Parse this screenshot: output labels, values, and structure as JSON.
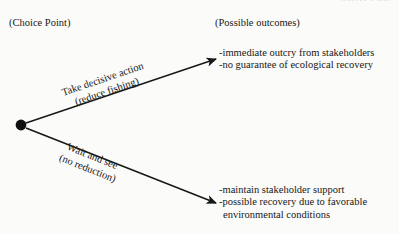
{
  "page": {
    "width": 399,
    "height": 234,
    "background_color": "#fbfbf9",
    "ink_color": "#171717",
    "running_header": "CHAPTER"
  },
  "headings": {
    "choice_point": "(Choice Point)",
    "possible_outcomes": "(Possible outcomes)"
  },
  "diagram": {
    "type": "decision-tree",
    "node": {
      "label": "",
      "shape": "filled-circle",
      "x": 21,
      "y": 125,
      "radius": 5
    },
    "branches": [
      {
        "id": "decisive-action",
        "label_line1": "Take decisive action",
        "label_line2": "(reduce fishing)",
        "from": {
          "x": 26,
          "y": 123
        },
        "to": {
          "x": 222,
          "y": 57
        },
        "arrowhead": true
      },
      {
        "id": "wait-and-see",
        "label_line1": "Wait and see",
        "label_line2": "(no reduction)",
        "from": {
          "x": 26,
          "y": 128
        },
        "to": {
          "x": 222,
          "y": 205
        },
        "arrowhead": true
      }
    ],
    "outcomes": [
      {
        "id": "decisive-action-outcomes",
        "lines": [
          "-immediate outcry  from stakeholders",
          "-no guarantee of ecological recovery"
        ]
      },
      {
        "id": "wait-and-see-outcomes",
        "lines": [
          "-maintain stakeholder support",
          "-possible recovery due to favorable",
          "environmental conditions"
        ]
      }
    ]
  }
}
